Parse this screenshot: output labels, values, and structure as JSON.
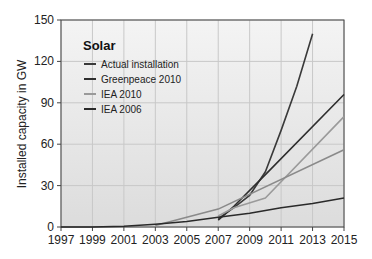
{
  "chart_data": {
    "type": "line",
    "title": "",
    "xlabel": "",
    "ylabel": "Installed capacity in GW",
    "xlim": [
      1997,
      2015
    ],
    "ylim": [
      0,
      150
    ],
    "x_ticks": [
      1997,
      1999,
      2001,
      2003,
      2005,
      2007,
      2009,
      2011,
      2013,
      2015
    ],
    "y_ticks": [
      0,
      30,
      60,
      90,
      120,
      150
    ],
    "grid": true,
    "legend": {
      "title": "Solar",
      "position": "upper-left",
      "entries": [
        "Actual installation",
        "Greenpeace 2010",
        "IEA 2010",
        "IEA 2006"
      ]
    },
    "series": [
      {
        "name": "Actual installation",
        "color": "#3a3a3a",
        "points": [
          [
            2007,
            6
          ],
          [
            2008,
            14
          ],
          [
            2009,
            23
          ],
          [
            2010,
            40
          ],
          [
            2011,
            70
          ],
          [
            2012,
            102
          ],
          [
            2013,
            140
          ]
        ]
      },
      {
        "name": "Greenpeace 2010",
        "color": "#2e2e2e",
        "points": [
          [
            2007,
            5
          ],
          [
            2008,
            15
          ],
          [
            2010,
            38
          ],
          [
            2015,
            96
          ]
        ]
      },
      {
        "name": "IEA 2010",
        "color": "#9a9a9a",
        "points": [
          [
            2007,
            8
          ],
          [
            2008,
            14
          ],
          [
            2010,
            21
          ],
          [
            2015,
            80
          ]
        ]
      },
      {
        "name": "IEA 2010 (lower)",
        "color": "#8a8a8a",
        "points": [
          [
            2003,
            1
          ],
          [
            2007,
            13
          ],
          [
            2015,
            56
          ]
        ]
      },
      {
        "name": "IEA 2006",
        "color": "#2a2a2a",
        "points": [
          [
            1997,
            0
          ],
          [
            1999,
            0
          ],
          [
            2001,
            0.5
          ],
          [
            2003,
            2
          ],
          [
            2005,
            4
          ],
          [
            2007,
            7
          ],
          [
            2009,
            10
          ],
          [
            2011,
            14
          ],
          [
            2013,
            17
          ],
          [
            2015,
            21
          ]
        ]
      }
    ]
  },
  "colors": {
    "plot_bg_top": "#f4f4f4",
    "plot_bg_bottom": "#dcdcdc",
    "grid": "#c8c8c8",
    "axis": "#444444"
  }
}
